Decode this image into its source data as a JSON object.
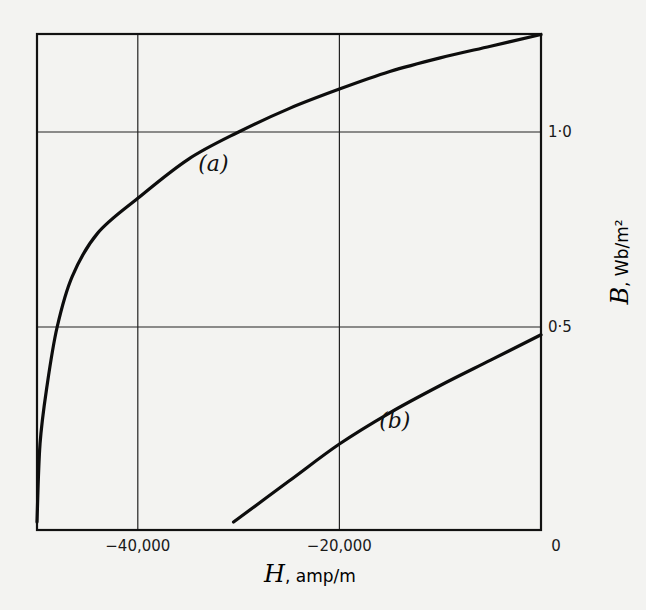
{
  "chart_data": {
    "type": "line",
    "title": "",
    "xlabel": "H, amp/m",
    "xlabel_symbol": "H",
    "xlabel_unit": "amp/m",
    "ylabel": "B, Wb/m²",
    "ylabel_symbol": "B",
    "ylabel_unit": "Wb/m²",
    "xlim": [
      -50000,
      0
    ],
    "ylim": [
      0,
      1.25
    ],
    "x_ticks": [
      {
        "value": -40000,
        "label": "-40,000"
      },
      {
        "value": -20000,
        "label": "-20,000"
      },
      {
        "value": 0,
        "label": "0"
      }
    ],
    "y_ticks": [
      {
        "value": 0.5,
        "label": "0·5"
      },
      {
        "value": 1.0,
        "label": "1·0"
      }
    ],
    "grid": true,
    "legend": "none",
    "series": [
      {
        "name": "(a)",
        "x": [
          -50000,
          -49700,
          -49000,
          -48000,
          -46500,
          -44000,
          -40000,
          -35000,
          -30000,
          -25000,
          -20000,
          -15000,
          -10000,
          -5000,
          0
        ],
        "y": [
          0.0,
          0.2,
          0.35,
          0.5,
          0.63,
          0.74,
          0.83,
          0.93,
          1.0,
          1.06,
          1.11,
          1.155,
          1.19,
          1.22,
          1.25
        ]
      },
      {
        "name": "(b)",
        "x": [
          -30500,
          -25000,
          -20000,
          -15000,
          -10000,
          -5000,
          0
        ],
        "y": [
          0.0,
          0.105,
          0.2,
          0.28,
          0.35,
          0.415,
          0.48
        ]
      }
    ],
    "annotations": [
      {
        "text": "(a)",
        "x": -32500,
        "y": 0.9
      },
      {
        "text": "(b)",
        "x": -14500,
        "y": 0.24
      }
    ]
  }
}
